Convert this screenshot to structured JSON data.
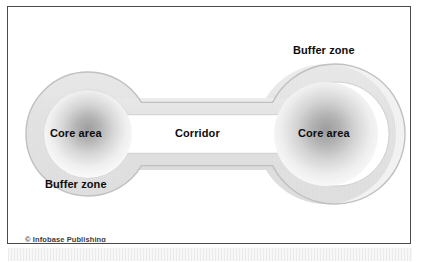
{
  "figure": {
    "type": "conservation-reserve-design-diagram",
    "credit": "© Infobase Publishing",
    "labels": {
      "core_left": "Core area",
      "core_right": "Core area",
      "buffer_top_right": "Buffer zone",
      "buffer_bottom_left": "Buffer zone",
      "corridor": "Corridor"
    },
    "colors": {
      "frame_border": "#4a4a4a",
      "page_background": "#ffffff",
      "buffer_fill": "#e4e4e4",
      "buffer_edge": "#c2c2c2",
      "core_center": "#a8a8a8",
      "core_edge": "#ffffff",
      "text": "#0d0d0d",
      "credit_text": "#3c3c3c",
      "texture_strip": "#eeeeee"
    },
    "geometry": {
      "left_core": {
        "cx": 72,
        "cy": 120,
        "r": 44
      },
      "right_core": {
        "cx": 310,
        "cy": 120,
        "r": 52
      },
      "left_buffer": {
        "cx": 72,
        "cy": 120,
        "r": 62
      },
      "right_buffer": {
        "cx": 310,
        "cy": 120,
        "r": 70
      },
      "corridor": {
        "x1": 110,
        "x2": 272,
        "cy": 120,
        "core_half_height": 18,
        "buffer_half_height": 36
      }
    }
  }
}
